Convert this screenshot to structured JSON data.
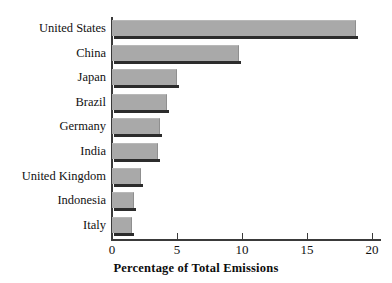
{
  "chart_data": {
    "type": "bar",
    "orientation": "horizontal",
    "title": "",
    "xlabel": "Percentage of Total Emissions",
    "ylabel": "",
    "categories": [
      "Italy",
      "Indonesia",
      "United Kingdom",
      "India",
      "Germany",
      "Brazil",
      "Japan",
      "China",
      "United States"
    ],
    "values": [
      1.5,
      1.7,
      2.2,
      3.5,
      3.7,
      4.2,
      5.0,
      9.8,
      18.8
    ],
    "xlim": [
      0,
      20
    ],
    "xticks": [
      0,
      5,
      10,
      15,
      20
    ],
    "xtick_labels": [
      "0",
      "5",
      "10",
      "15",
      "20"
    ],
    "grid": false,
    "legend": null,
    "bar_color": "#a9a9a9",
    "shadow_color": "#2c2c2c",
    "axis_color": "#3a3a3a",
    "background": "#ffffff"
  }
}
